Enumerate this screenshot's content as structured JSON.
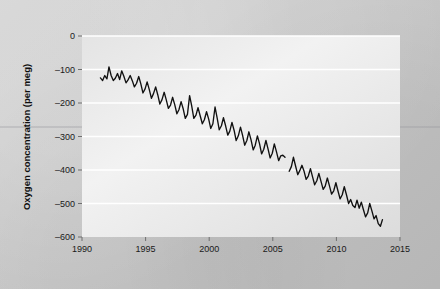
{
  "chart_data": {
    "type": "line",
    "title": "",
    "subtitle": "",
    "xlabel": "",
    "ylabel": "Oxygen concentration (per meg)",
    "xlim": [
      1990,
      2015
    ],
    "ylim": [
      -600,
      0
    ],
    "xticks": [
      1990,
      1995,
      2000,
      2005,
      2010,
      2015
    ],
    "xtick_labels": [
      "1990",
      "1995",
      "2000",
      "2005",
      "2010",
      "2015"
    ],
    "yticks": [
      0,
      -100,
      -200,
      -300,
      -400,
      -500,
      -600
    ],
    "ytick_labels": [
      "0",
      "–100",
      "–200",
      "–300",
      "–400",
      "–500",
      "–600"
    ],
    "grid": "horizontal-only",
    "grid_color": "#ffffff",
    "legend": "none",
    "line_color": "#111111",
    "panel_color": "#ececec",
    "figure_color": "#c9c9c9",
    "annotations": [
      {
        "text": "data gap / record break",
        "x": 2006.2,
        "y": -385
      }
    ],
    "series": [
      {
        "name": "Atmospheric O2 (per meg)",
        "color": "#111111",
        "segments": [
          {
            "name": "1991-2006",
            "x": [
              1991.45,
              1991.62,
              1991.79,
              1991.96,
              1992.12,
              1992.29,
              1992.46,
              1992.62,
              1992.79,
              1992.96,
              1993.12,
              1993.29,
              1993.46,
              1993.62,
              1993.79,
              1993.96,
              1994.12,
              1994.29,
              1994.46,
              1994.62,
              1994.79,
              1994.96,
              1995.12,
              1995.29,
              1995.46,
              1995.62,
              1995.79,
              1995.96,
              1996.12,
              1996.29,
              1996.46,
              1996.62,
              1996.79,
              1996.96,
              1997.12,
              1997.29,
              1997.46,
              1997.62,
              1997.79,
              1997.96,
              1998.12,
              1998.29,
              1998.46,
              1998.62,
              1998.79,
              1998.96,
              1999.12,
              1999.29,
              1999.46,
              1999.62,
              1999.79,
              1999.96,
              2000.12,
              2000.29,
              2000.46,
              2000.62,
              2000.79,
              2000.96,
              2001.12,
              2001.29,
              2001.46,
              2001.62,
              2001.79,
              2001.96,
              2002.12,
              2002.29,
              2002.46,
              2002.62,
              2002.79,
              2002.96,
              2003.12,
              2003.29,
              2003.46,
              2003.62,
              2003.79,
              2003.96,
              2004.12,
              2004.29,
              2004.46,
              2004.62,
              2004.79,
              2004.96,
              2005.12,
              2005.29,
              2005.46,
              2005.62,
              2005.79,
              2005.96
            ],
            "y": [
              -125,
              -133,
              -118,
              -128,
              -92,
              -118,
              -133,
              -126,
              -112,
              -130,
              -104,
              -120,
              -140,
              -131,
              -118,
              -134,
              -152,
              -141,
              -121,
              -142,
              -170,
              -158,
              -137,
              -160,
              -186,
              -172,
              -152,
              -176,
              -203,
              -190,
              -168,
              -190,
              -216,
              -206,
              -183,
              -205,
              -232,
              -220,
              -196,
              -218,
              -246,
              -234,
              -178,
              -208,
              -246,
              -236,
              -214,
              -238,
              -262,
              -250,
              -226,
              -248,
              -276,
              -262,
              -212,
              -244,
              -280,
              -268,
              -244,
              -268,
              -296,
              -284,
              -258,
              -282,
              -312,
              -298,
              -272,
              -296,
              -326,
              -312,
              -286,
              -310,
              -340,
              -326,
              -298,
              -322,
              -352,
              -338,
              -312,
              -336,
              -364,
              -350,
              -322,
              -346,
              -372,
              -358,
              -356,
              -362
            ]
          },
          {
            "name": "2006-2013",
            "x": [
              2006.29,
              2006.46,
              2006.62,
              2006.79,
              2006.96,
              2007.12,
              2007.29,
              2007.46,
              2007.62,
              2007.79,
              2007.96,
              2008.12,
              2008.29,
              2008.46,
              2008.62,
              2008.79,
              2008.96,
              2009.12,
              2009.29,
              2009.46,
              2009.62,
              2009.79,
              2009.96,
              2010.12,
              2010.29,
              2010.46,
              2010.62,
              2010.79,
              2010.96,
              2011.12,
              2011.29,
              2011.46,
              2011.62,
              2011.79,
              2011.96,
              2012.12,
              2012.29,
              2012.46,
              2012.62,
              2012.79,
              2012.96,
              2013.12,
              2013.29,
              2013.46,
              2013.62
            ],
            "y": [
              -404,
              -390,
              -362,
              -388,
              -414,
              -402,
              -386,
              -404,
              -428,
              -418,
              -396,
              -420,
              -444,
              -432,
              -410,
              -434,
              -458,
              -448,
              -424,
              -448,
              -472,
              -462,
              -438,
              -462,
              -486,
              -474,
              -450,
              -474,
              -500,
              -488,
              -506,
              -512,
              -490,
              -514,
              -496,
              -518,
              -540,
              -528,
              -500,
              -522,
              -546,
              -536,
              -560,
              -568,
              -548
            ]
          }
        ]
      }
    ]
  }
}
